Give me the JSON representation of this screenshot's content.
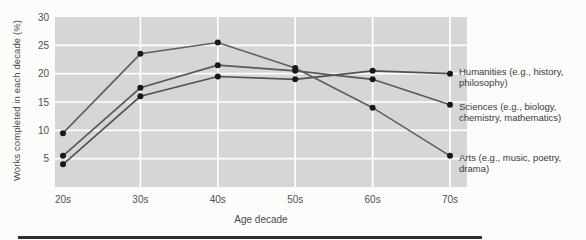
{
  "chart_data": {
    "type": "line",
    "title": "",
    "xlabel": "Age decade",
    "ylabel": "Works completed in each decade (%)",
    "categories": [
      "20s",
      "30s",
      "40s",
      "50s",
      "60s",
      "70s"
    ],
    "yticks": [
      30,
      25,
      20,
      15,
      10,
      5
    ],
    "ylim": [
      0,
      30
    ],
    "grid": "white gridlines on gray plot background",
    "legend_position": "right-of-plot",
    "plot_bg_color": "#d6d6d6",
    "grid_color": "#ffffff",
    "point_color": "#1a1817",
    "series": [
      {
        "name": "Humanities",
        "label": "Humanities (e.g., history, philosophy)",
        "values": [
          4,
          16,
          19.5,
          19,
          20.5,
          20
        ],
        "color": "#55504c"
      },
      {
        "name": "Sciences",
        "label": "Sciences (e.g., biology, chemistry, mathematics)",
        "values": [
          5.5,
          17.5,
          21.5,
          20.5,
          19,
          14.5
        ],
        "color": "#5e5752"
      },
      {
        "name": "Arts",
        "label": "Arts (e.g., music, poetry, drama)",
        "values": [
          9.5,
          23.5,
          25.5,
          21,
          14,
          5.5
        ],
        "color": "#675d56"
      }
    ]
  }
}
